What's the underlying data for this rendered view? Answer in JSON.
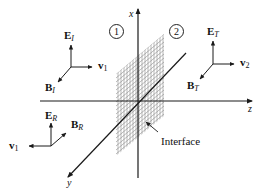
{
  "figure": {
    "type": "electromagnetic wave reflection/transmission at an interface",
    "axes": {
      "x_label": "x",
      "y_label": "y",
      "z_label": "z"
    },
    "regions": [
      {
        "id": "1",
        "label": "1"
      },
      {
        "id": "2",
        "label": "2"
      }
    ],
    "interface_label": "Interface",
    "incident": {
      "E": {
        "main": "E",
        "sub": "I"
      },
      "B": {
        "main": "B",
        "sub": "I"
      },
      "v": {
        "main": "v",
        "sub": "1"
      }
    },
    "transmitted": {
      "E": {
        "main": "E",
        "sub": "T"
      },
      "B": {
        "main": "B",
        "sub": "T"
      },
      "v": {
        "main": "v",
        "sub": "2"
      }
    },
    "reflected": {
      "E": {
        "main": "E",
        "sub": "R"
      },
      "B": {
        "main": "B",
        "sub": "R"
      },
      "v": {
        "main": "v",
        "sub": "1"
      }
    },
    "colors": {
      "line": "#1a1a1a",
      "grid": "#8a8a8a",
      "background": "#ffffff"
    }
  }
}
